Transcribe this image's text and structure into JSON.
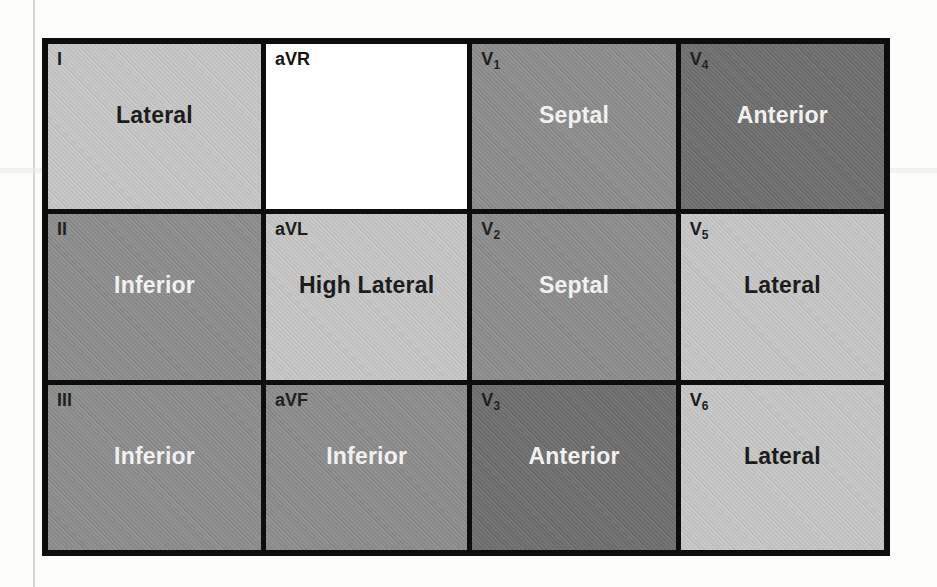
{
  "figure": {
    "description": "ECG lead localization grid",
    "palette": {
      "page_background": "#fcfcfa",
      "grid_line": "#0d0d0d",
      "cell_light": "#c7c7c7",
      "cell_medium": "#8d8d8d",
      "cell_dark": "#6f6f6f",
      "cell_white": "#fefefe",
      "text_dark": "#151515",
      "text_light": "#f7f7f7"
    },
    "grid": {
      "columns": 4,
      "rows": 3,
      "cells": [
        {
          "lead": "I",
          "sub": "",
          "territory": "Lateral",
          "shade": "light"
        },
        {
          "lead": "aVR",
          "sub": "",
          "territory": "",
          "shade": "white"
        },
        {
          "lead": "V",
          "sub": "1",
          "territory": "Septal",
          "shade": "medium"
        },
        {
          "lead": "V",
          "sub": "4",
          "territory": "Anterior",
          "shade": "dark"
        },
        {
          "lead": "II",
          "sub": "",
          "territory": "Inferior",
          "shade": "medium"
        },
        {
          "lead": "aVL",
          "sub": "",
          "territory": "High Lateral",
          "shade": "light"
        },
        {
          "lead": "V",
          "sub": "2",
          "territory": "Septal",
          "shade": "medium"
        },
        {
          "lead": "V",
          "sub": "5",
          "territory": "Lateral",
          "shade": "light"
        },
        {
          "lead": "III",
          "sub": "",
          "territory": "Inferior",
          "shade": "medium"
        },
        {
          "lead": "aVF",
          "sub": "",
          "territory": "Inferior",
          "shade": "medium"
        },
        {
          "lead": "V",
          "sub": "3",
          "territory": "Anterior",
          "shade": "dark"
        },
        {
          "lead": "V",
          "sub": "6",
          "territory": "Lateral",
          "shade": "light"
        }
      ]
    }
  }
}
